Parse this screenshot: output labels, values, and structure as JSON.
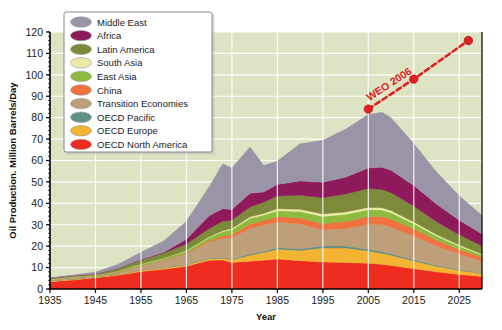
{
  "chart_data": {
    "type": "area",
    "title": "",
    "subtitle": "",
    "xlabel": "Year",
    "ylabel": "Oil Production. Million Barrels/Day",
    "xlim": [
      1935,
      2030
    ],
    "ylim": [
      0,
      120
    ],
    "xticks": [
      "1935",
      "1945",
      "1955",
      "1965",
      "1975",
      "1985",
      "1995",
      "2005",
      "2015",
      "2025"
    ],
    "xtick_values": [
      1935,
      1945,
      1955,
      1965,
      1975,
      1985,
      1995,
      2005,
      2015,
      2025
    ],
    "yticks": [
      "0",
      "10",
      "20",
      "30",
      "40",
      "50",
      "60",
      "70",
      "80",
      "90",
      "100",
      "110",
      "120"
    ],
    "ytick_values": [
      0,
      10,
      20,
      30,
      40,
      50,
      60,
      70,
      80,
      90,
      100,
      110,
      120
    ],
    "grid": true,
    "grid_color": "#ffffff",
    "plot_background": "#dde4c3",
    "stacked": true,
    "legend_position": "top-left",
    "x": [
      1935,
      1940,
      1945,
      1950,
      1955,
      1960,
      1965,
      1970,
      1973,
      1975,
      1979,
      1982,
      1985,
      1990,
      1995,
      2000,
      2005,
      2008,
      2010,
      2015,
      2020,
      2025,
      2030
    ],
    "series": [
      {
        "name": "OECD North America",
        "color": "#ee2d20",
        "values": [
          3.4,
          4.2,
          5.2,
          6.4,
          8.2,
          9.2,
          10.6,
          13.4,
          13.5,
          12.4,
          13.0,
          13.4,
          14.0,
          13.2,
          12.6,
          12.4,
          12.0,
          11.5,
          11.0,
          9.5,
          8.0,
          6.8,
          5.8
        ]
      },
      {
        "name": "OECD Europe",
        "color": "#f4b433",
        "values": [
          0.3,
          0.3,
          0.3,
          0.4,
          0.5,
          0.6,
          0.6,
          0.7,
          0.9,
          1.2,
          2.8,
          3.6,
          4.6,
          4.8,
          6.6,
          6.8,
          5.8,
          5.2,
          4.8,
          3.6,
          2.6,
          1.9,
          1.4
        ]
      },
      {
        "name": "OECD Pacific",
        "color": "#5f8f85",
        "values": [
          0.1,
          0.1,
          0.1,
          0.1,
          0.1,
          0.1,
          0.2,
          0.3,
          0.3,
          0.4,
          0.5,
          0.6,
          0.7,
          0.8,
          0.9,
          0.9,
          0.8,
          0.8,
          0.7,
          0.6,
          0.5,
          0.4,
          0.3
        ]
      },
      {
        "name": "Transition Economies",
        "color": "#bda07a",
        "values": [
          0.5,
          0.7,
          0.6,
          1.0,
          2.0,
          3.4,
          5.2,
          7.6,
          9.0,
          10.0,
          12.0,
          12.4,
          12.0,
          11.6,
          7.4,
          8.2,
          11.6,
          12.6,
          12.4,
          11.0,
          9.0,
          7.2,
          5.6
        ]
      },
      {
        "name": "China",
        "color": "#ef7240",
        "values": [
          0.0,
          0.0,
          0.0,
          0.0,
          0.1,
          0.2,
          0.3,
          0.6,
          1.1,
          1.5,
          2.1,
          2.0,
          2.5,
          2.8,
          3.0,
          3.2,
          3.6,
          3.8,
          3.8,
          3.4,
          2.8,
          2.2,
          1.7
        ]
      },
      {
        "name": "East Asia",
        "color": "#8cbb3f",
        "values": [
          0.2,
          0.3,
          0.1,
          0.4,
          0.7,
          0.8,
          0.9,
          1.5,
          2.0,
          2.2,
          2.6,
          2.5,
          2.7,
          3.0,
          3.4,
          3.4,
          3.2,
          3.0,
          2.9,
          2.4,
          1.9,
          1.5,
          1.1
        ]
      },
      {
        "name": "South Asia",
        "color": "#edeaa7",
        "values": [
          0.0,
          0.0,
          0.0,
          0.0,
          0.1,
          0.1,
          0.2,
          0.3,
          0.4,
          0.5,
          0.7,
          0.8,
          1.0,
          1.0,
          1.1,
          1.1,
          1.1,
          1.0,
          1.0,
          0.8,
          0.6,
          0.5,
          0.4
        ]
      },
      {
        "name": "Latin America",
        "color": "#7d8a3a",
        "values": [
          0.5,
          0.6,
          0.7,
          1.3,
          1.8,
          2.4,
          3.0,
          3.8,
          4.4,
          3.9,
          4.6,
          5.2,
          5.9,
          6.6,
          7.6,
          8.4,
          8.8,
          8.6,
          8.4,
          7.4,
          6.0,
          4.8,
          3.8
        ]
      },
      {
        "name": "Africa",
        "color": "#8e1a5c",
        "values": [
          0.0,
          0.0,
          0.0,
          0.1,
          0.3,
          0.4,
          2.2,
          6.0,
          5.9,
          5.0,
          6.4,
          4.8,
          5.4,
          6.6,
          7.2,
          7.8,
          9.6,
          10.4,
          10.4,
          9.6,
          8.2,
          6.8,
          5.6
        ]
      },
      {
        "name": "Middle East",
        "color": "#9b93a6",
        "values": [
          0.3,
          0.3,
          0.9,
          1.8,
          3.4,
          5.2,
          8.4,
          13.6,
          21.0,
          19.4,
          21.6,
          12.4,
          11.0,
          17.4,
          19.6,
          22.4,
          25.0,
          25.6,
          24.6,
          19.6,
          15.0,
          11.4,
          8.6
        ]
      }
    ],
    "annotations": [
      {
        "text": "WEO 2006",
        "color": "#e02020",
        "style": "dashed-line-with-markers",
        "points": [
          {
            "x": 2005,
            "y": 84
          },
          {
            "x": 2015,
            "y": 98
          },
          {
            "x": 2027,
            "y": 116
          }
        ]
      }
    ],
    "legend": [
      {
        "label": "Middle East",
        "color": "#9b93a6"
      },
      {
        "label": "Africa",
        "color": "#8e1a5c"
      },
      {
        "label": "Latin America",
        "color": "#7d8a3a"
      },
      {
        "label": "South Asia",
        "color": "#edeaa7"
      },
      {
        "label": "East Asia",
        "color": "#8cbb3f"
      },
      {
        "label": "China",
        "color": "#ef7240"
      },
      {
        "label": "Transition Economies",
        "color": "#bda07a"
      },
      {
        "label": "OECD Pacific",
        "color": "#5f8f85"
      },
      {
        "label": "OECD Europe",
        "color": "#f4b433"
      },
      {
        "label": "OECD North America",
        "color": "#ee2d20"
      }
    ]
  }
}
